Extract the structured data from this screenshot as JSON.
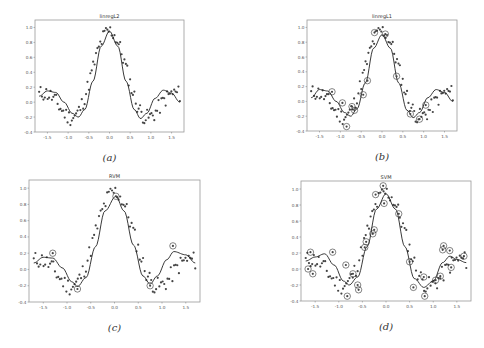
{
  "figure": {
    "panels": [
      {
        "id": "a",
        "title": "linregL2",
        "caption": "(a)",
        "box": [
          35,
          20,
          184,
          132
        ],
        "circled": "none"
      },
      {
        "id": "b",
        "title": "linregL1",
        "caption": "(b)",
        "box": [
          307,
          20,
          457,
          131
        ],
        "circled": "some"
      },
      {
        "id": "c",
        "title": "RVM",
        "caption": "(c)",
        "box": [
          29,
          180,
          200,
          302
        ],
        "circled": "few"
      },
      {
        "id": "d",
        "title": "SVM",
        "caption": "(d)",
        "box": [
          301,
          181,
          471,
          301
        ],
        "circled": "many"
      }
    ]
  },
  "chart_data": [
    {
      "type": "scatter",
      "title": "linregL2",
      "xlabel": "",
      "ylabel": "",
      "xlim": [
        -1.8,
        1.8
      ],
      "ylim": [
        -0.4,
        1.1
      ],
      "xticks": [
        "-1.5",
        "-1.0",
        "-0.5",
        "0.0",
        "0.5",
        "1.0",
        "1.5"
      ],
      "yticks": [
        "-0.4",
        "-0.2",
        "0.0",
        "0.2",
        "0.4",
        "0.6",
        "0.8",
        "1.0"
      ],
      "series": [
        {
          "name": "data",
          "kind": "scatter",
          "note": "noisy samples of sinc-like function, ~100 points"
        },
        {
          "name": "fit",
          "kind": "line",
          "x": [
            -1.7,
            -1.5,
            -1.3,
            -1.1,
            -0.9,
            -0.75,
            -0.6,
            -0.4,
            -0.2,
            0.0,
            0.2,
            0.4,
            0.6,
            0.75,
            0.9,
            1.1,
            1.3,
            1.5,
            1.7
          ],
          "y": [
            0.08,
            0.15,
            0.13,
            0.0,
            -0.15,
            -0.2,
            -0.1,
            0.28,
            0.75,
            0.95,
            0.75,
            0.28,
            -0.1,
            -0.22,
            -0.15,
            0.05,
            0.16,
            0.12,
            0.0
          ]
        }
      ],
      "grid": false,
      "legend": false
    },
    {
      "type": "scatter",
      "title": "linregL1",
      "xlim": [
        -1.8,
        1.8
      ],
      "ylim": [
        -0.4,
        1.1
      ],
      "xticks": [
        "-1.5",
        "-1.0",
        "-0.5",
        "0.0",
        "0.5",
        "1.0",
        "1.5"
      ],
      "yticks": [
        "-0.4",
        "-0.2",
        "0.0",
        "0.2",
        "0.4",
        "0.6",
        "0.8",
        "1.0"
      ],
      "series": [
        {
          "name": "data",
          "kind": "scatter"
        },
        {
          "name": "fit",
          "kind": "line",
          "x": [
            -1.7,
            -1.5,
            -1.3,
            -1.1,
            -0.9,
            -0.75,
            -0.6,
            -0.4,
            -0.2,
            0.0,
            0.2,
            0.4,
            0.6,
            0.75,
            0.9,
            1.1,
            1.3,
            1.5,
            1.7
          ],
          "y": [
            0.05,
            0.16,
            0.14,
            0.0,
            -0.15,
            -0.2,
            -0.1,
            0.25,
            0.72,
            0.9,
            0.72,
            0.25,
            -0.12,
            -0.22,
            -0.15,
            0.05,
            0.16,
            0.12,
            0.0
          ]
        },
        {
          "name": "selected (circled)",
          "kind": "scatter",
          "x": [
            -1.2,
            -0.95,
            -0.85,
            -0.72,
            -0.66,
            -0.45,
            -0.35,
            -0.18,
            0.08,
            0.35,
            0.68,
            0.9,
            1.05
          ],
          "y": [
            0.13,
            -0.02,
            -0.34,
            -0.07,
            -0.12,
            0.09,
            0.28,
            0.93,
            0.91,
            0.34,
            -0.17,
            -0.24,
            -0.05
          ]
        }
      ]
    },
    {
      "type": "scatter",
      "title": "RVM",
      "xlim": [
        -1.8,
        1.8
      ],
      "ylim": [
        -0.4,
        1.1
      ],
      "xticks": [
        "-1.5",
        "-1.0",
        "-0.5",
        "0.0",
        "0.5",
        "1.0",
        "1.5"
      ],
      "yticks": [
        "-0.4",
        "-0.2",
        "0.0",
        "0.2",
        "0.4",
        "0.6",
        "0.8",
        "1.0"
      ],
      "series": [
        {
          "name": "data",
          "kind": "scatter"
        },
        {
          "name": "fit",
          "kind": "line",
          "x": [
            -1.7,
            -1.5,
            -1.3,
            -1.1,
            -0.9,
            -0.78,
            -0.6,
            -0.4,
            -0.2,
            0.03,
            0.2,
            0.4,
            0.6,
            0.75,
            0.9,
            1.1,
            1.25,
            1.5,
            1.7
          ],
          "y": [
            0.08,
            0.15,
            0.14,
            0.02,
            -0.15,
            -0.21,
            -0.1,
            0.28,
            0.72,
            0.9,
            0.72,
            0.3,
            -0.08,
            -0.18,
            -0.08,
            0.12,
            0.22,
            0.18,
            0.08
          ]
        },
        {
          "name": "relevance vectors (circled)",
          "kind": "scatter",
          "x": [
            -1.3,
            -0.78,
            0.03,
            0.75,
            1.23
          ],
          "y": [
            0.2,
            -0.24,
            0.9,
            -0.2,
            0.29
          ]
        }
      ]
    },
    {
      "type": "scatter",
      "title": "SVM",
      "xlim": [
        -1.8,
        1.8
      ],
      "ylim": [
        -0.4,
        1.1
      ],
      "xticks": [
        "-1.5",
        "-1.0",
        "-0.5",
        "0.0",
        "0.5",
        "1.0",
        "1.5"
      ],
      "yticks": [
        "-0.4",
        "-0.2",
        "0.0",
        "0.2",
        "0.4",
        "0.6",
        "0.8",
        "1.0"
      ],
      "series": [
        {
          "name": "data",
          "kind": "scatter"
        },
        {
          "name": "fit",
          "kind": "line",
          "x": [
            -1.7,
            -1.5,
            -1.3,
            -1.1,
            -0.9,
            -0.78,
            -0.6,
            -0.4,
            -0.2,
            0.0,
            0.2,
            0.4,
            0.6,
            0.8,
            1.0,
            1.2,
            1.35,
            1.5,
            1.7
          ],
          "y": [
            0.1,
            0.15,
            0.19,
            0.05,
            -0.15,
            -0.2,
            -0.1,
            0.28,
            0.75,
            0.94,
            0.75,
            0.28,
            -0.12,
            -0.23,
            -0.15,
            0.08,
            0.16,
            0.12,
            0.08
          ]
        },
        {
          "name": "support vectors (circled)",
          "kind": "scatter",
          "x": [
            -1.65,
            -1.6,
            -1.55,
            -1.13,
            -0.85,
            -0.82,
            -0.7,
            -0.6,
            -0.58,
            -0.45,
            -0.42,
            -0.28,
            -0.25,
            -0.22,
            -0.06,
            -0.04,
            0.27,
            0.5,
            0.58,
            0.8,
            0.82,
            1.05,
            1.15,
            1.2,
            1.22,
            1.35,
            1.38,
            1.65
          ],
          "y": [
            0.0,
            0.21,
            -0.06,
            0.21,
            0.05,
            -0.34,
            -0.06,
            -0.2,
            -0.26,
            0.27,
            0.34,
            0.44,
            0.49,
            0.93,
            1.04,
            0.82,
            0.69,
            0.09,
            -0.23,
            -0.1,
            -0.34,
            -0.14,
            -0.09,
            0.24,
            0.29,
            0.23,
            0.02,
            0.16
          ]
        }
      ]
    }
  ]
}
